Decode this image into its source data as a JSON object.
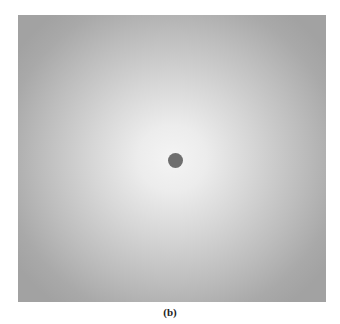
{
  "figure": {
    "dot_color": "#6e6e6e",
    "center_color": "#f4f4f4",
    "edge_color": "#a2a2a2"
  },
  "caption": "(b)"
}
